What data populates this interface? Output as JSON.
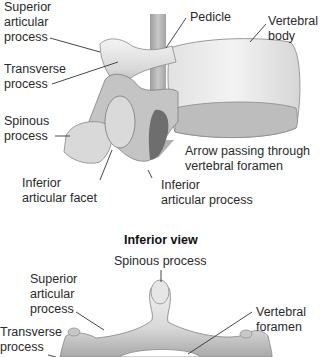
{
  "lateral_view": {
    "labels": {
      "superior_articular_process": [
        "Superior",
        "articular",
        "process"
      ],
      "transverse_process": [
        "Transverse",
        "process"
      ],
      "spinous_process": [
        "Spinous",
        "process"
      ],
      "inferior_articular_facet": [
        "Inferior",
        "articular facet"
      ],
      "pedicle": "Pedicle",
      "vertebral_body": [
        "Vertebral",
        "body"
      ],
      "arrow_caption": [
        "Arrow passing through",
        "vertebral foramen"
      ],
      "inferior_articular_process": [
        "Inferior",
        "articular process"
      ]
    }
  },
  "inferior_view": {
    "heading": "Inferior view",
    "labels": {
      "spinous_process": "Spinous process",
      "superior_articular_process": [
        "Superior",
        "articular",
        "process"
      ],
      "transverse_process": [
        "Transverse",
        "process"
      ],
      "vertebral_foramen": [
        "Vertebral",
        "foramen"
      ]
    }
  },
  "colors": {
    "bone_light": "#ececec",
    "bone_mid": "#c9c9c9",
    "bone_dark": "#8e8e8e",
    "arrow": "#b5b5b5",
    "leader_line": "#333333"
  }
}
